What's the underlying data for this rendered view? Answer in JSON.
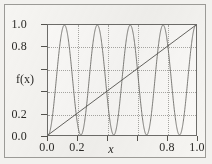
{
  "figure": {
    "background_color": "#f6f5f2",
    "panel_color": "#fbfaf8",
    "frame_color": "#9b9a96",
    "axis_color": "#6e6d6a",
    "grid_color": "#a9a8a4",
    "curve_color": "#6f6e6a",
    "line_color": "#55544f"
  },
  "axes": {
    "ylabel": "f(x)",
    "xlabel": "x",
    "y_tick_labels": [
      "1.0",
      "0.8",
      "",
      "",
      "0.2",
      "0.0"
    ],
    "y_tick_values": [
      1.0,
      0.8,
      0.6,
      0.4,
      0.2,
      0.0
    ],
    "x_tick_labels": [
      "0.0",
      "0.2",
      "",
      "",
      "0.8",
      "1.0"
    ],
    "x_tick_values": [
      0.0,
      0.2,
      0.4,
      0.6,
      0.8,
      1.0
    ]
  },
  "chart_data": {
    "type": "line",
    "title": "",
    "xlabel": "x",
    "ylabel": "f(x)",
    "xlim": [
      0.0,
      1.0
    ],
    "ylim": [
      0.0,
      1.0
    ],
    "xticks": [
      0.0,
      0.2,
      0.4,
      0.6,
      0.8,
      1.0
    ],
    "yticks": [
      0.0,
      0.2,
      0.4,
      0.6,
      0.8,
      1.0
    ],
    "xtick_labels": [
      "0.0",
      "0.2",
      "",
      "",
      "0.8",
      "1.0"
    ],
    "ytick_labels": [
      "0.0",
      "0.2",
      "",
      "",
      "0.8",
      "1.0"
    ],
    "grid": true,
    "grid_style": "dotted",
    "legend": false,
    "series": [
      {
        "name": "oscillation",
        "description": "high-frequency sinusoid oscillating between 0 and 1, about 4.5 cycles over the interval",
        "formula": "0.5 - 0.5*cos(2*pi*x/0.2222)",
        "period": 0.2222,
        "amplitude": 0.5,
        "offset": 0.5,
        "x": [
          0.0,
          0.02,
          0.04,
          0.06,
          0.08,
          0.1,
          0.11,
          0.13,
          0.15,
          0.17,
          0.19,
          0.21,
          0.22,
          0.24,
          0.26,
          0.28,
          0.3,
          0.32,
          0.33,
          0.35,
          0.37,
          0.39,
          0.41,
          0.43,
          0.44,
          0.46,
          0.48,
          0.5,
          0.52,
          0.54,
          0.56,
          0.57,
          0.59,
          0.61,
          0.63,
          0.65,
          0.67,
          0.68,
          0.7,
          0.72,
          0.74,
          0.76,
          0.78,
          0.79,
          0.81,
          0.83,
          0.85,
          0.87,
          0.89,
          0.9,
          0.92,
          0.94,
          0.96,
          0.98,
          1.0
        ],
        "y": [
          0.0,
          0.08,
          0.3,
          0.59,
          0.86,
          1.0,
          0.98,
          0.81,
          0.52,
          0.23,
          0.04,
          0.01,
          0.06,
          0.26,
          0.54,
          0.82,
          0.99,
          0.99,
          0.92,
          0.69,
          0.39,
          0.14,
          0.01,
          0.03,
          0.1,
          0.34,
          0.64,
          0.89,
          1.0,
          0.94,
          0.72,
          0.56,
          0.27,
          0.06,
          0.0,
          0.1,
          0.37,
          0.51,
          0.8,
          0.97,
          0.99,
          0.85,
          0.57,
          0.41,
          0.15,
          0.01,
          0.03,
          0.21,
          0.51,
          0.66,
          0.9,
          1.0,
          0.93,
          0.68,
          0.33
        ]
      },
      {
        "name": "identity-line",
        "description": "straight diagonal line from (0,0) to (1,1)",
        "formula": "y = x",
        "x": [
          0.0,
          1.0
        ],
        "y": [
          0.0,
          1.0
        ]
      }
    ]
  }
}
